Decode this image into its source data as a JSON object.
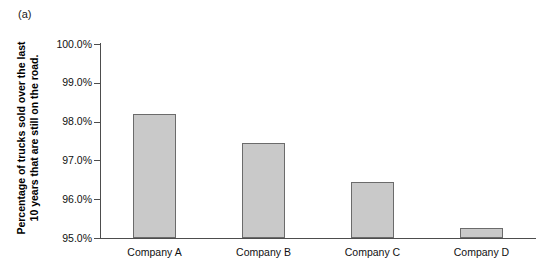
{
  "panel": {
    "label": "(a)"
  },
  "chart_data": {
    "type": "bar",
    "title": "",
    "subtitle": "",
    "xlabel": "",
    "ylabel": "Percentage of trucks sold over the last\n10 years that are still on the road.",
    "categories": [
      "Company A",
      "Company B",
      "Company C",
      "Company D"
    ],
    "values": [
      98.2,
      97.45,
      96.45,
      95.25
    ],
    "ylim": [
      95.0,
      100.0
    ],
    "ytick_values": [
      100.0,
      99.0,
      98.0,
      97.0,
      96.0,
      95.0
    ],
    "ytick_labels": [
      "100.0%",
      "99.0%",
      "98.0%",
      "97.0%",
      "96.0%",
      "95.0%"
    ],
    "grid": false,
    "legend": null,
    "legend_position": "none",
    "bar_fill_color": "#c9c9c9",
    "bar_edge_color": "#6b6b6b",
    "axis_color": "#4d4d4d",
    "background_color": "#ffffff"
  }
}
